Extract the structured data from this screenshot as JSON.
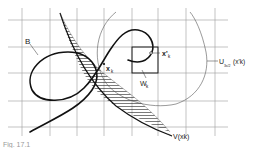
{
  "figure": {
    "type": "mathematical-diagram",
    "grid": {
      "vertical_x": [
        22,
        50,
        77,
        104,
        132,
        158,
        186,
        215
      ],
      "horizontal_y": [
        20,
        47,
        73,
        101,
        127
      ],
      "color": "#9a9a9a"
    },
    "labels": {
      "curve": "B",
      "point": "x",
      "point_sub": "k",
      "point_prime": "x'",
      "point_prime_sub": "k",
      "square": "W",
      "square_sub": "k",
      "neighborhood": "U",
      "neighborhood_sub": "3ε/2",
      "neighborhood_arg": "(x'k)",
      "region": "V(xk)"
    },
    "caption": "Fig. 17.1"
  }
}
